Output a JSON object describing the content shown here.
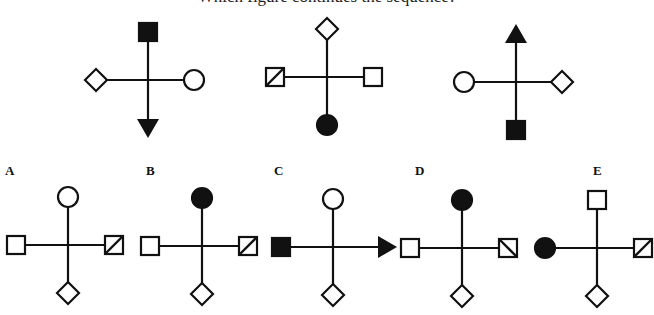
{
  "header": {
    "instruction_text": "Which figure continues the sequence?",
    "note": "Text is clipped at top edge; only bottom of glyphs visible"
  },
  "sequence": [
    {
      "id": "seq-1",
      "center": [
        148,
        80
      ],
      "arms": {
        "top": {
          "shape": "square",
          "fill": "black"
        },
        "left": {
          "shape": "diamond",
          "fill": "white"
        },
        "right": {
          "shape": "circle",
          "fill": "white"
        },
        "bottom": {
          "shape": "arrow-down",
          "fill": "black"
        }
      }
    },
    {
      "id": "seq-2",
      "center": [
        327,
        77
      ],
      "arms": {
        "top": {
          "shape": "diamond",
          "fill": "white"
        },
        "left": {
          "shape": "square-slash",
          "fill": "white"
        },
        "right": {
          "shape": "square",
          "fill": "white"
        },
        "bottom": {
          "shape": "circle",
          "fill": "black"
        }
      }
    },
    {
      "id": "seq-3",
      "center": [
        516,
        82
      ],
      "arms": {
        "top": {
          "shape": "arrow-up",
          "fill": "black"
        },
        "left": {
          "shape": "circle",
          "fill": "white"
        },
        "right": {
          "shape": "diamond",
          "fill": "white"
        },
        "bottom": {
          "shape": "square",
          "fill": "black"
        }
      }
    }
  ],
  "options": [
    {
      "label": "A",
      "label_pos": [
        5,
        175
      ],
      "center": [
        68,
        245
      ],
      "arms": {
        "top": {
          "shape": "circle",
          "fill": "white"
        },
        "left": {
          "shape": "square",
          "fill": "white"
        },
        "right": {
          "shape": "square-slash",
          "fill": "white"
        },
        "bottom": {
          "shape": "diamond",
          "fill": "white"
        }
      }
    },
    {
      "label": "B",
      "label_pos": [
        146,
        175
      ],
      "center": [
        202,
        246
      ],
      "arms": {
        "top": {
          "shape": "circle",
          "fill": "black"
        },
        "left": {
          "shape": "square",
          "fill": "white"
        },
        "right": {
          "shape": "square-slash",
          "fill": "white"
        },
        "bottom": {
          "shape": "diamond",
          "fill": "white"
        }
      }
    },
    {
      "label": "C",
      "label_pos": [
        274,
        175
      ],
      "center": [
        333,
        247
      ],
      "arms": {
        "top": {
          "shape": "circle",
          "fill": "white"
        },
        "left": {
          "shape": "square",
          "fill": "black"
        },
        "right": {
          "shape": "arrow-right",
          "fill": "black"
        },
        "bottom": {
          "shape": "diamond",
          "fill": "white"
        }
      }
    },
    {
      "label": "D",
      "label_pos": [
        415,
        175
      ],
      "center": [
        462,
        248
      ],
      "arms": {
        "top": {
          "shape": "circle",
          "fill": "black"
        },
        "left": {
          "shape": "square",
          "fill": "white"
        },
        "right": {
          "shape": "square-backslash",
          "fill": "white"
        },
        "bottom": {
          "shape": "diamond",
          "fill": "white"
        }
      }
    },
    {
      "label": "E",
      "label_pos": [
        593,
        175
      ],
      "center": [
        597,
        248
      ],
      "arms": {
        "top": {
          "shape": "square",
          "fill": "white"
        },
        "left": {
          "shape": "circle",
          "fill": "black"
        },
        "right": {
          "shape": "square-slash",
          "fill": "white"
        },
        "bottom": {
          "shape": "diamond",
          "fill": "white"
        }
      }
    }
  ],
  "style": {
    "stroke": "#111111",
    "fill_black": "#111111",
    "fill_white": "#ffffff"
  }
}
